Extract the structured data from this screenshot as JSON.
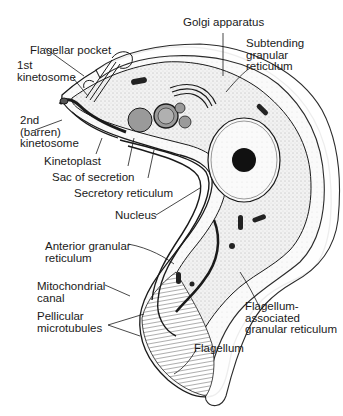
{
  "figure": {
    "labels": {
      "golgi": "Golgi apparatus",
      "subtending": "Subtending\ngranular\nreticulum",
      "flagellar_pocket": "Flagellar pocket",
      "first_kinetosome": "1st\nkinetosome",
      "second_kinetosome": "2nd\n(barren)\nkinetosome",
      "kinetoplast": "Kinetoplast",
      "sac_secretion": "Sac of secretion",
      "secretory_reticulum": "Secretory reticulum",
      "nucleus": "Nucleus",
      "anterior_granular": "Anterior granular\nreticulum",
      "mito_canal": "Mitochondrial\ncanal",
      "pellicular": "Pellicular\nmicrotubules",
      "flagellum_assoc": "Flagellum-\nassociated\ngranular reticulum",
      "flagellum": "Flagellum"
    },
    "colors": {
      "ink": "#1a1a1a",
      "stipple": "#e8e8e8",
      "vesicle": "#9a9a9a",
      "background": "#ffffff"
    }
  }
}
